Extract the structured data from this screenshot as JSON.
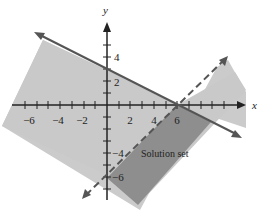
{
  "diagram": {
    "title": "",
    "axes": {
      "x_label": "x",
      "y_label": "y",
      "x_ticks": [
        {
          "value": -6,
          "label": "−6"
        },
        {
          "value": -4,
          "label": "−4"
        },
        {
          "value": -2,
          "label": "−2"
        },
        {
          "value": 2,
          "label": "2"
        },
        {
          "value": 4,
          "label": "4"
        },
        {
          "value": 6,
          "label": "6"
        }
      ],
      "y_ticks": [
        {
          "value": 4,
          "label": "4"
        },
        {
          "value": 2,
          "label": "2"
        },
        {
          "value": -4,
          "label": "−4"
        },
        {
          "value": -6,
          "label": "−6"
        }
      ]
    },
    "lines": [
      {
        "name": "solid boundary",
        "style": "solid",
        "through": [
          [
            0,
            3
          ],
          [
            6,
            0
          ]
        ]
      },
      {
        "name": "dashed boundary",
        "style": "dashed",
        "through": [
          [
            0,
            -6
          ],
          [
            6,
            0
          ]
        ]
      }
    ],
    "region_label": "Solution set",
    "colors": {
      "light_shade": "#c8c8c8",
      "dark_shade": "#8c8c8c",
      "line": "#555555"
    }
  }
}
